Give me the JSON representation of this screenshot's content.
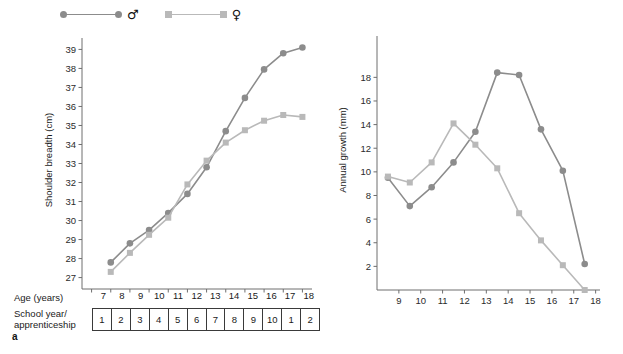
{
  "legend": {
    "items": [
      {
        "name": "male",
        "symbol": "♂",
        "marker": "circle",
        "color": "#8c8c8c"
      },
      {
        "name": "female",
        "symbol": "♀",
        "marker": "square",
        "color": "#b9b9b9"
      }
    ]
  },
  "panel_a": {
    "letter": "a",
    "age_row_label": "Age (years)",
    "age_ticks": [
      "7",
      "8",
      "9",
      "10",
      "11",
      "12",
      "13",
      "14",
      "15",
      "16",
      "17",
      "18"
    ],
    "school_row_label_line1": "School year/",
    "school_row_label_line2": "apprenticeship",
    "school_cells": [
      "1",
      "2",
      "3",
      "4",
      "5",
      "6",
      "7",
      "8",
      "9",
      "10",
      "1",
      "2"
    ]
  },
  "panel_b": {
    "letter": "b"
  },
  "chart_data": [
    {
      "id": "panel_a",
      "type": "line",
      "title": "",
      "xlabel": "Age (years)",
      "ylabel": "Shoulder breadth (cm)",
      "xlim": [
        6.5,
        18.5
      ],
      "ylim": [
        26.4,
        39.6
      ],
      "yticks": [
        27,
        28,
        29,
        30,
        31,
        32,
        33,
        34,
        35,
        36,
        37,
        38,
        39
      ],
      "xticks": [
        7,
        8,
        9,
        10,
        11,
        12,
        13,
        14,
        15,
        16,
        17,
        18
      ],
      "grid": false,
      "legend_position": "top-left",
      "x": [
        8,
        9,
        10,
        11,
        12,
        13,
        14,
        15,
        16,
        17,
        18
      ],
      "series": [
        {
          "name": "♂",
          "label": "male",
          "marker": "circle",
          "color": "#8c8c8c",
          "values": [
            27.8,
            28.8,
            29.5,
            30.4,
            31.4,
            32.8,
            34.7,
            36.45,
            37.95,
            38.8,
            39.1
          ]
        },
        {
          "name": "♀",
          "label": "female",
          "marker": "square",
          "color": "#b9b9b9",
          "values": [
            27.3,
            28.3,
            29.25,
            30.15,
            31.9,
            33.15,
            34.1,
            34.75,
            35.25,
            35.55,
            35.45
          ]
        }
      ]
    },
    {
      "id": "panel_b",
      "type": "line",
      "title": "",
      "xlabel": "",
      "ylabel": "Annual growth (mm)",
      "xlim": [
        8.0,
        18.2
      ],
      "ylim": [
        0,
        21.5
      ],
      "yticks": [
        2,
        4,
        6,
        8,
        10,
        12,
        14,
        16,
        18
      ],
      "xticks": [
        9,
        10,
        11,
        12,
        13,
        14,
        15,
        16,
        17,
        18
      ],
      "grid": false,
      "legend_position": "none",
      "x": [
        8.5,
        9.5,
        10.5,
        11.5,
        12.5,
        13.5,
        14.5,
        15.5,
        16.5,
        17.5
      ],
      "series": [
        {
          "name": "♂",
          "label": "male",
          "marker": "circle",
          "color": "#8c8c8c",
          "values": [
            9.5,
            7.1,
            8.7,
            10.8,
            13.4,
            18.4,
            18.2,
            13.6,
            10.1,
            2.2
          ]
        },
        {
          "name": "♀",
          "label": "female",
          "marker": "square",
          "color": "#b9b9b9",
          "values": [
            9.6,
            9.1,
            10.8,
            14.1,
            12.3,
            10.3,
            6.5,
            4.2,
            2.1,
            0.0
          ]
        }
      ]
    }
  ]
}
